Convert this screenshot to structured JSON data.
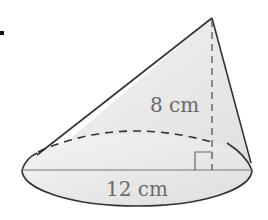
{
  "figure": {
    "type": "cone",
    "labels": {
      "height": "8 cm",
      "diameter": "12 cm"
    },
    "colors": {
      "fill": "#e6e6e6",
      "stroke": "#333333",
      "label": "#6a6a6a"
    }
  }
}
